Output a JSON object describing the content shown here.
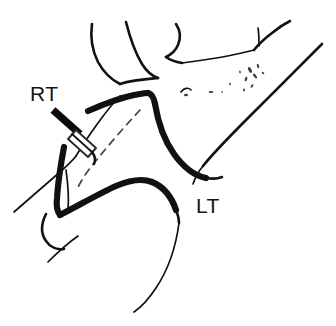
{
  "figure": {
    "kind": "anatomical-line-drawing",
    "background_color": "#ffffff",
    "ink_color": "#111111",
    "width": 336,
    "height": 326
  },
  "labels": [
    {
      "id": "rt",
      "text": "RT",
      "meaning": "right side",
      "x": 30,
      "y": 101
    },
    {
      "id": "lt",
      "text": "LT",
      "meaning": "left side",
      "x": 196,
      "y": 213
    }
  ],
  "annotations": {
    "needle": {
      "name": "needle-probe",
      "description": "Dark needle shaft entering from upper left with a light rectangular hub"
    },
    "trajectory": {
      "name": "needle-trajectory",
      "description": "Dashed line indicating needle path"
    },
    "stipple": {
      "name": "stipple-texture",
      "description": "Faint stippled shading marks"
    }
  }
}
